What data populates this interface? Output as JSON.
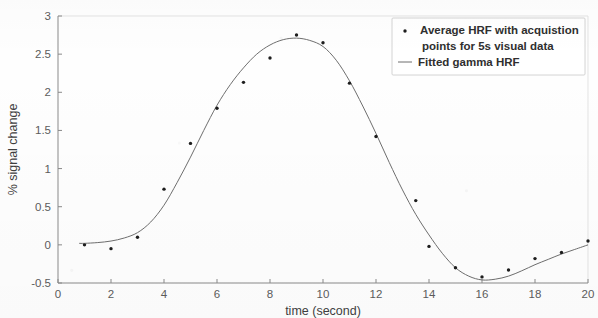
{
  "chart_data": {
    "type": "scatter",
    "title": "",
    "xlabel": "time (second)",
    "ylabel": "% signal change",
    "xlim": [
      0,
      20
    ],
    "ylim": [
      -0.5,
      3
    ],
    "xticks": [
      0,
      2,
      4,
      6,
      8,
      10,
      12,
      14,
      16,
      18,
      20
    ],
    "xtick_labels": [
      "0",
      "2",
      "4",
      "6",
      "8",
      "10",
      "12",
      "14",
      "16",
      "18",
      "20"
    ],
    "yticks": [
      -0.5,
      0,
      0.5,
      1,
      1.5,
      2,
      2.5,
      3
    ],
    "ytick_labels": [
      "-0.5",
      "0",
      "0.5",
      "1",
      "1.5",
      "2",
      "2.5",
      "3"
    ],
    "grid": false,
    "legend_position": "upper right",
    "series": [
      {
        "name": "Average HRF with acquistion points for 5s visual data",
        "marker": "dot",
        "type": "scatter",
        "color": "#1d1d1d",
        "x": [
          1,
          2,
          3,
          4,
          5,
          6,
          7,
          8,
          9,
          10,
          11,
          12,
          13.5,
          14,
          15,
          16,
          17,
          18,
          19,
          20
        ],
        "y": [
          0.0,
          -0.05,
          0.1,
          0.73,
          1.33,
          1.79,
          2.13,
          2.45,
          2.75,
          2.65,
          2.12,
          1.42,
          0.58,
          -0.02,
          -0.3,
          -0.42,
          -0.33,
          -0.18,
          -0.1,
          0.05
        ]
      },
      {
        "name": "Fitted gamma HRF",
        "marker": "line",
        "type": "line",
        "color": "#6e6e6e",
        "x": [
          0.8,
          1,
          1.5,
          2,
          2.5,
          3,
          3.5,
          4,
          4.5,
          5,
          5.5,
          6,
          6.5,
          7,
          7.5,
          8,
          8.5,
          9,
          9.5,
          10,
          10.5,
          11,
          11.5,
          12,
          12.5,
          13,
          13.5,
          14,
          14.5,
          15,
          15.5,
          16,
          16.5,
          17,
          17.5,
          18,
          18.5,
          19,
          19.5,
          20
        ],
        "y": [
          0.02,
          0.02,
          0.03,
          0.05,
          0.09,
          0.16,
          0.3,
          0.52,
          0.82,
          1.15,
          1.5,
          1.83,
          2.1,
          2.32,
          2.5,
          2.62,
          2.69,
          2.71,
          2.68,
          2.6,
          2.42,
          2.15,
          1.82,
          1.46,
          1.08,
          0.72,
          0.4,
          0.13,
          -0.11,
          -0.3,
          -0.41,
          -0.46,
          -0.45,
          -0.41,
          -0.34,
          -0.26,
          -0.19,
          -0.12,
          -0.06,
          0.0
        ]
      }
    ]
  },
  "legend": {
    "entries": [
      {
        "label_line1": "Average HRF with acquistion",
        "label_line2": "points for 5s visual data",
        "marker": "dot"
      },
      {
        "label_line1": "Fitted gamma HRF",
        "label_line2": "",
        "marker": "line"
      }
    ]
  },
  "colors": {
    "point": "#1d1d1d",
    "curve": "#6e6e6e",
    "axis": "#8a8a8a",
    "text": "#3f3f3f",
    "background": "#fefefe"
  }
}
